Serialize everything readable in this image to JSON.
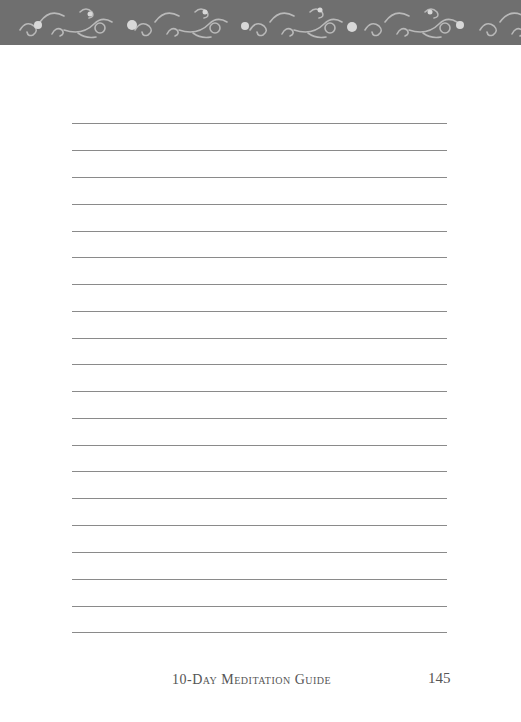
{
  "header": {
    "pattern": "swirl-ornament-icon",
    "color": "#6f6f6f"
  },
  "writing_area": {
    "line_count": 20,
    "line_color": "#8a8a8a"
  },
  "footer": {
    "title": "10-Day Meditation Guide",
    "page_number": "145"
  }
}
